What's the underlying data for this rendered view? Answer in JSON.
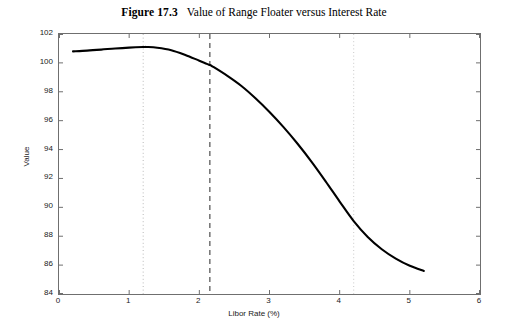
{
  "caption": {
    "number": "Figure 17.3",
    "title": "Value of Range Floater versus Interest Rate"
  },
  "chart_data": {
    "type": "line",
    "title": "Value of Range Floater versus Interest Rate",
    "xlabel": "Libor Rate (%)",
    "ylabel": "Value",
    "xlim": [
      0,
      6
    ],
    "ylim": [
      84,
      102
    ],
    "xticks": [
      0,
      1,
      2,
      3,
      4,
      5,
      6
    ],
    "xtick_labels": [
      "0",
      "1",
      "2",
      "3",
      "4",
      "5",
      "6"
    ],
    "yticks": [
      84,
      86,
      88,
      90,
      92,
      94,
      96,
      98,
      100,
      102
    ],
    "ytick_labels": [
      "84",
      "86",
      "88",
      "90",
      "92",
      "94",
      "96",
      "98",
      "100",
      "102"
    ],
    "grid": false,
    "legend": null,
    "line_color": "#000000",
    "line_width": 2.1,
    "series": [
      {
        "name": "Range floater value",
        "x": [
          0.2,
          0.4,
          0.6,
          0.8,
          1.0,
          1.2,
          1.25,
          1.4,
          1.6,
          1.8,
          2.0,
          2.15,
          2.2,
          2.4,
          2.6,
          2.8,
          3.0,
          3.2,
          3.4,
          3.6,
          3.8,
          4.0,
          4.2,
          4.4,
          4.6,
          4.8,
          5.0,
          5.2
        ],
        "y": [
          100.8,
          100.85,
          100.92,
          101.0,
          101.06,
          101.1,
          101.1,
          101.05,
          100.88,
          100.55,
          100.15,
          99.85,
          99.72,
          99.1,
          98.4,
          97.55,
          96.6,
          95.55,
          94.4,
          93.15,
          91.8,
          90.4,
          89.05,
          87.95,
          87.1,
          86.45,
          85.95,
          85.6
        ]
      }
    ],
    "vertical_markers": [
      {
        "name": "lower-barrier",
        "x": 1.2,
        "style": "dotted",
        "color": "#b9b9b9"
      },
      {
        "name": "current-rate",
        "x": 2.15,
        "style": "dashed",
        "color": "#4d4d4d"
      },
      {
        "name": "upper-barrier",
        "x": 4.2,
        "style": "dotted",
        "color": "#c9c9c9"
      }
    ]
  }
}
